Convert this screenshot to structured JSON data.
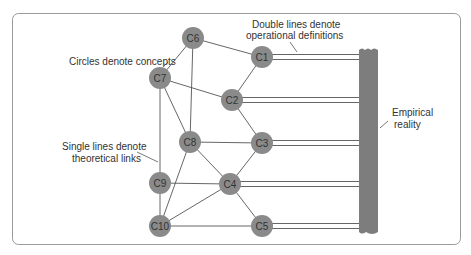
{
  "annotations": {
    "circles": "Circles denote concepts",
    "single_line_1": "Single lines denote",
    "single_line_2": "theoretical links",
    "double_line_1": "Double lines denote",
    "double_line_2": "operational definitions",
    "empirical_1": "Empirical",
    "empirical_2": "reality"
  },
  "nodes": [
    {
      "id": "C1",
      "label": "C1",
      "x": 262,
      "y": 57
    },
    {
      "id": "C2",
      "label": "C2",
      "x": 232,
      "y": 100
    },
    {
      "id": "C3",
      "label": "C3",
      "x": 262,
      "y": 143
    },
    {
      "id": "C4",
      "label": "C4",
      "x": 230,
      "y": 184
    },
    {
      "id": "C5",
      "label": "C5",
      "x": 262,
      "y": 226
    },
    {
      "id": "C6",
      "label": "C6",
      "x": 193,
      "y": 38
    },
    {
      "id": "C7",
      "label": "C7",
      "x": 160,
      "y": 78
    },
    {
      "id": "C8",
      "label": "C8",
      "x": 190,
      "y": 142
    },
    {
      "id": "C9",
      "label": "C9",
      "x": 160,
      "y": 183
    },
    {
      "id": "C10",
      "label": "C10",
      "x": 160,
      "y": 226
    }
  ],
  "theoretical_links": [
    [
      "C6",
      "C1"
    ],
    [
      "C6",
      "C7"
    ],
    [
      "C6",
      "C8"
    ],
    [
      "C7",
      "C2"
    ],
    [
      "C7",
      "C8"
    ],
    [
      "C7",
      "C9"
    ],
    [
      "C1",
      "C2"
    ],
    [
      "C2",
      "C3"
    ],
    [
      "C8",
      "C3"
    ],
    [
      "C8",
      "C4"
    ],
    [
      "C8",
      "C10"
    ],
    [
      "C3",
      "C4"
    ],
    [
      "C9",
      "C4"
    ],
    [
      "C9",
      "C10"
    ],
    [
      "C4",
      "C10"
    ],
    [
      "C4",
      "C5"
    ],
    [
      "C10",
      "C5"
    ]
  ],
  "operational_links": [
    "C1",
    "C2",
    "C3",
    "C4",
    "C5"
  ],
  "colors": {
    "node_fill": "#8a8a8a",
    "node_text": "#333333",
    "line": "#555555",
    "bar": "#7d7d7d",
    "frame": "#9a9a9a"
  }
}
